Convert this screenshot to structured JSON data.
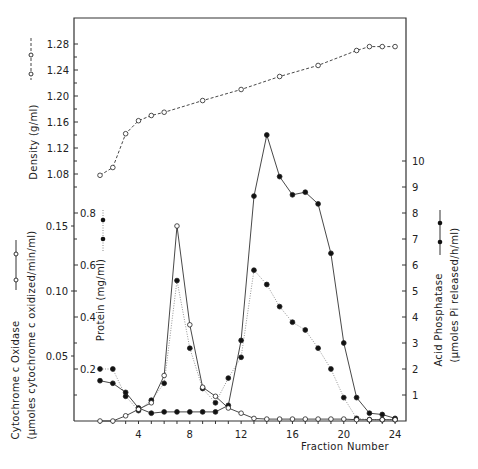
{
  "chart_data": {
    "type": "line",
    "title": "",
    "xlabel": "Fraction Number",
    "x_ticks": [
      4,
      8,
      12,
      16,
      20,
      24
    ],
    "xlim": [
      0,
      25
    ],
    "grid": false,
    "panels": [
      {
        "name": "density",
        "ylabel": "Density (g/ml)",
        "y_ticks": [
          "1.08",
          "1.12",
          "1.16",
          "1.20",
          "1.24",
          "1.28"
        ],
        "ylim": [
          1.04,
          1.31
        ],
        "series": [
          {
            "name": "Density",
            "style": "dashed line, open circles",
            "x": [
              1,
              2,
              3,
              4,
              5,
              6,
              9,
              12,
              15,
              18,
              21,
              22,
              23,
              24
            ],
            "values": [
              1.078,
              1.09,
              1.142,
              1.162,
              1.17,
              1.175,
              1.193,
              1.21,
              1.23,
              1.247,
              1.27,
              1.276,
              1.276,
              1.276
            ]
          }
        ]
      },
      {
        "name": "enzymes",
        "series": [
          {
            "name": "Cytochrome c Oxidase",
            "axis": "left-outer",
            "ylabel": "Cytochrome c Oxidase (µmoles cytochrome c oxidized/min/ml)",
            "y_ticks": [
              "0.05",
              "0.10",
              "0.15"
            ],
            "ylim": [
              0,
              0.17
            ],
            "style": "solid line, open circles",
            "x": [
              1,
              2,
              3,
              4,
              5,
              6,
              7,
              8,
              9,
              10,
              11,
              12,
              13,
              14,
              15,
              16,
              17,
              18,
              19,
              20,
              21,
              22,
              23,
              24
            ],
            "values": [
              0,
              0,
              0.004,
              0.009,
              0.014,
              0.035,
              0.15,
              0.074,
              0.026,
              0.019,
              0.01,
              0.006,
              0.002,
              0.0015,
              0.0015,
              0.0015,
              0.0015,
              0.0015,
              0.0015,
              0.0015,
              0.001,
              0.001,
              0.001,
              0.001
            ]
          },
          {
            "name": "Protein",
            "axis": "left-inner",
            "ylabel": "Protein (mg/ml)",
            "y_ticks": [
              "0.2",
              "0.4",
              "0.6",
              "0.8"
            ],
            "ylim": [
              0,
              0.85
            ],
            "style": "dotted line, filled circles",
            "x": [
              1,
              2,
              3,
              4,
              5,
              6,
              7,
              8,
              9,
              10,
              11,
              12,
              13,
              14,
              15,
              16,
              17,
              18,
              19,
              20,
              21,
              22,
              23,
              24
            ],
            "values": [
              0.2,
              0.2,
              0.095,
              0.04,
              0.08,
              0.145,
              0.54,
              0.28,
              0.125,
              0.07,
              0.165,
              0.245,
              0.58,
              0.525,
              0.44,
              0.38,
              0.35,
              0.28,
              0.2,
              0.09,
              0.01,
              0.005,
              0.005,
              0.005
            ]
          },
          {
            "name": "Acid Phosphatase",
            "axis": "right",
            "ylabel": "Acid Phosphatase (µmoles Pi released/h/ml)",
            "y_ticks": [
              "1",
              "2",
              "3",
              "4",
              "5",
              "6",
              "7",
              "8",
              "9",
              "10"
            ],
            "ylim": [
              0,
              11.5
            ],
            "style": "solid line, filled circles",
            "x": [
              1,
              2,
              3,
              4,
              5,
              6,
              7,
              8,
              9,
              10,
              11,
              12,
              13,
              14,
              15,
              16,
              17,
              18,
              19,
              20,
              21,
              22,
              23,
              24
            ],
            "values": [
              1.55,
              1.45,
              1.1,
              0.5,
              0.3,
              0.35,
              0.35,
              0.35,
              0.35,
              0.35,
              0.6,
              3.1,
              8.65,
              11.0,
              9.4,
              8.7,
              8.8,
              8.35,
              6.45,
              3.0,
              0.9,
              0.3,
              0.25,
              0.1
            ]
          }
        ]
      }
    ]
  },
  "labels": {
    "density_axis": "Density  (g/ml)",
    "protein_axis": "Protein  (mg/ml)",
    "cyto_title": "Cytochrome  c  Oxidase",
    "cyto_units": "(µmoles  cytochrome  c  oxidized/min/ml)",
    "acid_title": "Acid  Phosphatase",
    "acid_units": "(µmoles  Pi  released/h/ml)",
    "x_axis": "Fraction  Number"
  }
}
